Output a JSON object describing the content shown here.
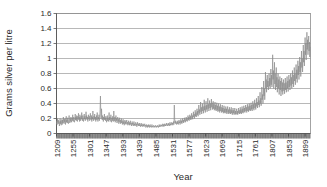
{
  "chart_data": {
    "type": "line",
    "title": "",
    "xlabel": "Year",
    "ylabel": "Grams silver per litre",
    "xlim": [
      1209,
      1914
    ],
    "ylim": [
      0,
      1.6
    ],
    "grid": true,
    "legend": "none",
    "series_color": "#8a8a8a",
    "y_ticks": [
      "0",
      "0.2",
      "0.4",
      "0.6",
      "0.8",
      "1",
      "1.2",
      "1.4",
      "1.6"
    ],
    "y_tick_values": [
      0,
      0.2,
      0.4,
      0.6,
      0.8,
      1,
      1.2,
      1.4,
      1.6
    ],
    "x_ticks": [
      "1209",
      "1255",
      "1301",
      "1347",
      "1393",
      "1439",
      "1485",
      "1531",
      "1577",
      "1623",
      "1669",
      "1715",
      "1761",
      "1807",
      "1853",
      "1899"
    ],
    "x_tick_values": [
      1209,
      1255,
      1301,
      1347,
      1393,
      1439,
      1485,
      1531,
      1577,
      1623,
      1669,
      1715,
      1761,
      1807,
      1853,
      1899
    ],
    "series": [
      {
        "name": "Grams silver per litre",
        "x_start": 1209,
        "x_step": 1,
        "values": [
          0.13,
          0.17,
          0.12,
          0.2,
          0.15,
          0.18,
          0.13,
          0.16,
          0.1,
          0.14,
          0.2,
          0.13,
          0.17,
          0.11,
          0.16,
          0.19,
          0.12,
          0.18,
          0.14,
          0.22,
          0.16,
          0.13,
          0.19,
          0.15,
          0.2,
          0.12,
          0.17,
          0.23,
          0.15,
          0.18,
          0.14,
          0.21,
          0.16,
          0.13,
          0.19,
          0.24,
          0.17,
          0.14,
          0.2,
          0.16,
          0.22,
          0.18,
          0.15,
          0.21,
          0.17,
          0.25,
          0.19,
          0.16,
          0.22,
          0.18,
          0.15,
          0.2,
          0.26,
          0.18,
          0.22,
          0.17,
          0.24,
          0.19,
          0.16,
          0.23,
          0.2,
          0.27,
          0.18,
          0.22,
          0.16,
          0.25,
          0.2,
          0.17,
          0.23,
          0.19,
          0.28,
          0.21,
          0.17,
          0.24,
          0.2,
          0.16,
          0.22,
          0.26,
          0.19,
          0.23,
          0.17,
          0.21,
          0.29,
          0.2,
          0.24,
          0.18,
          0.22,
          0.16,
          0.2,
          0.25,
          0.19,
          0.23,
          0.17,
          0.21,
          0.27,
          0.2,
          0.18,
          0.24,
          0.16,
          0.22,
          0.19,
          0.3,
          0.21,
          0.17,
          0.23,
          0.2,
          0.26,
          0.18,
          0.22,
          0.16,
          0.2,
          0.24,
          0.18,
          0.28,
          0.2,
          0.16,
          0.22,
          0.19,
          0.25,
          0.17,
          0.21,
          0.32,
          0.5,
          0.27,
          0.2,
          0.33,
          0.22,
          0.18,
          0.24,
          0.2,
          0.16,
          0.22,
          0.19,
          0.26,
          0.18,
          0.21,
          0.17,
          0.23,
          0.2,
          0.15,
          0.19,
          0.24,
          0.17,
          0.21,
          0.16,
          0.2,
          0.28,
          0.18,
          0.22,
          0.16,
          0.2,
          0.25,
          0.18,
          0.15,
          0.21,
          0.17,
          0.23,
          0.19,
          0.16,
          0.3,
          0.2,
          0.17,
          0.22,
          0.15,
          0.19,
          0.24,
          0.17,
          0.2,
          0.14,
          0.18,
          0.22,
          0.16,
          0.19,
          0.13,
          0.17,
          0.21,
          0.15,
          0.18,
          0.13,
          0.16,
          0.2,
          0.14,
          0.17,
          0.12,
          0.16,
          0.19,
          0.13,
          0.16,
          0.11,
          0.15,
          0.18,
          0.13,
          0.16,
          0.12,
          0.15,
          0.18,
          0.13,
          0.15,
          0.11,
          0.14,
          0.17,
          0.12,
          0.15,
          0.11,
          0.14,
          0.17,
          0.12,
          0.14,
          0.1,
          0.13,
          0.16,
          0.12,
          0.14,
          0.1,
          0.13,
          0.16,
          0.11,
          0.13,
          0.1,
          0.12,
          0.15,
          0.11,
          0.13,
          0.09,
          0.12,
          0.15,
          0.11,
          0.13,
          0.1,
          0.12,
          0.14,
          0.1,
          0.12,
          0.09,
          0.11,
          0.14,
          0.1,
          0.12,
          0.09,
          0.11,
          0.13,
          0.1,
          0.12,
          0.09,
          0.11,
          0.13,
          0.1,
          0.11,
          0.08,
          0.1,
          0.12,
          0.09,
          0.11,
          0.08,
          0.1,
          0.12,
          0.09,
          0.11,
          0.08,
          0.1,
          0.12,
          0.09,
          0.1,
          0.08,
          0.1,
          0.12,
          0.09,
          0.1,
          0.08,
          0.1,
          0.11,
          0.09,
          0.1,
          0.08,
          0.1,
          0.11,
          0.09,
          0.1,
          0.08,
          0.09,
          0.11,
          0.09,
          0.1,
          0.08,
          0.1,
          0.12,
          0.09,
          0.11,
          0.09,
          0.1,
          0.12,
          0.1,
          0.11,
          0.09,
          0.11,
          0.13,
          0.1,
          0.12,
          0.09,
          0.11,
          0.13,
          0.1,
          0.12,
          0.1,
          0.11,
          0.14,
          0.11,
          0.12,
          0.1,
          0.12,
          0.14,
          0.11,
          0.13,
          0.1,
          0.12,
          0.15,
          0.11,
          0.13,
          0.11,
          0.12,
          0.15,
          0.12,
          0.14,
          0.11,
          0.13,
          0.16,
          0.12,
          0.38,
          0.2,
          0.14,
          0.17,
          0.13,
          0.15,
          0.12,
          0.14,
          0.17,
          0.13,
          0.16,
          0.12,
          0.15,
          0.18,
          0.14,
          0.16,
          0.12,
          0.15,
          0.19,
          0.14,
          0.17,
          0.13,
          0.16,
          0.2,
          0.15,
          0.18,
          0.14,
          0.17,
          0.21,
          0.16,
          0.19,
          0.15,
          0.18,
          0.22,
          0.17,
          0.2,
          0.16,
          0.19,
          0.24,
          0.18,
          0.22,
          0.17,
          0.2,
          0.25,
          0.19,
          0.23,
          0.18,
          0.22,
          0.27,
          0.2,
          0.24,
          0.19,
          0.23,
          0.29,
          0.22,
          0.26,
          0.2,
          0.25,
          0.31,
          0.23,
          0.28,
          0.22,
          0.26,
          0.33,
          0.25,
          0.3,
          0.23,
          0.28,
          0.38,
          0.27,
          0.32,
          0.25,
          0.3,
          0.42,
          0.29,
          0.35,
          0.26,
          0.31,
          0.4,
          0.3,
          0.36,
          0.27,
          0.33,
          0.45,
          0.31,
          0.37,
          0.28,
          0.34,
          0.43,
          0.32,
          0.38,
          0.29,
          0.35,
          0.47,
          0.33,
          0.39,
          0.3,
          0.36,
          0.44,
          0.34,
          0.4,
          0.31,
          0.37,
          0.46,
          0.35,
          0.41,
          0.32,
          0.38,
          0.43,
          0.33,
          0.39,
          0.31,
          0.36,
          0.42,
          0.32,
          0.38,
          0.3,
          0.35,
          0.41,
          0.31,
          0.37,
          0.29,
          0.34,
          0.4,
          0.3,
          0.36,
          0.28,
          0.33,
          0.39,
          0.3,
          0.35,
          0.28,
          0.32,
          0.38,
          0.29,
          0.34,
          0.27,
          0.32,
          0.37,
          0.28,
          0.33,
          0.27,
          0.31,
          0.36,
          0.28,
          0.33,
          0.26,
          0.31,
          0.36,
          0.28,
          0.32,
          0.26,
          0.3,
          0.35,
          0.27,
          0.32,
          0.26,
          0.3,
          0.35,
          0.27,
          0.31,
          0.25,
          0.3,
          0.34,
          0.27,
          0.31,
          0.25,
          0.29,
          0.34,
          0.26,
          0.3,
          0.25,
          0.29,
          0.33,
          0.26,
          0.3,
          0.25,
          0.29,
          0.34,
          0.27,
          0.31,
          0.26,
          0.3,
          0.35,
          0.27,
          0.32,
          0.26,
          0.31,
          0.36,
          0.28,
          0.33,
          0.27,
          0.31,
          0.37,
          0.29,
          0.34,
          0.28,
          0.32,
          0.38,
          0.3,
          0.35,
          0.28,
          0.33,
          0.39,
          0.3,
          0.36,
          0.29,
          0.34,
          0.4,
          0.31,
          0.37,
          0.3,
          0.35,
          0.41,
          0.32,
          0.38,
          0.3,
          0.36,
          0.43,
          0.33,
          0.39,
          0.31,
          0.37,
          0.45,
          0.34,
          0.4,
          0.32,
          0.38,
          0.47,
          0.36,
          0.42,
          0.34,
          0.4,
          0.5,
          0.38,
          0.44,
          0.35,
          0.42,
          0.55,
          0.4,
          0.47,
          0.37,
          0.44,
          0.62,
          0.45,
          0.52,
          0.4,
          0.48,
          0.7,
          0.5,
          0.6,
          0.45,
          0.55,
          0.82,
          0.6,
          0.72,
          0.55,
          0.68,
          0.78,
          0.62,
          0.7,
          0.58,
          0.66,
          0.8,
          0.63,
          0.74,
          0.6,
          0.7,
          0.86,
          0.65,
          0.78,
          0.62,
          0.72,
          1.05,
          0.72,
          0.84,
          0.6,
          0.76,
          0.95,
          0.66,
          0.8,
          0.58,
          0.72,
          0.88,
          0.62,
          0.75,
          0.55,
          0.68,
          0.8,
          0.6,
          0.72,
          0.52,
          0.65,
          0.76,
          0.58,
          0.7,
          0.5,
          0.63,
          0.74,
          0.56,
          0.68,
          0.52,
          0.62,
          0.72,
          0.57,
          0.67,
          0.53,
          0.63,
          0.74,
          0.58,
          0.68,
          0.55,
          0.65,
          0.76,
          0.6,
          0.7,
          0.56,
          0.67,
          0.78,
          0.62,
          0.72,
          0.58,
          0.69,
          0.8,
          0.64,
          0.75,
          0.6,
          0.71,
          0.84,
          0.66,
          0.78,
          0.62,
          0.74,
          0.88,
          0.7,
          0.8,
          0.65,
          0.77,
          0.92,
          0.73,
          0.85,
          0.68,
          0.8,
          0.97,
          0.78,
          0.9,
          0.72,
          0.85,
          1.02,
          0.82,
          0.95,
          0.76,
          0.9,
          1.1,
          0.88,
          1.0,
          0.82,
          0.96,
          1.18,
          0.95,
          1.1,
          0.9,
          1.05,
          1.28,
          1.05,
          1.2,
          0.98,
          1.15,
          1.35,
          1.12,
          1.25,
          1.05,
          1.2,
          1.3,
          1.1,
          1.22,
          1.02,
          1.15
        ]
      }
    ]
  },
  "axis": {
    "y_title": "Grams silver per litre",
    "x_title": "Year"
  }
}
